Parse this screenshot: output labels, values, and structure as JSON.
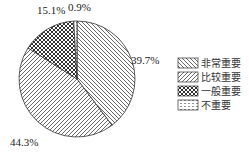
{
  "chart_data": {
    "type": "pie",
    "title": "",
    "categories": [
      "非常重要",
      "比较重要",
      "一般重要",
      "不重要"
    ],
    "values": [
      39.7,
      44.3,
      15.1,
      0.9
    ],
    "labels": [
      "39.7%",
      "44.3%",
      "15.1%",
      "0.9%"
    ],
    "start_angle_deg": 0,
    "direction": "clockwise",
    "fills": [
      "hatch-backslash",
      "hatch-slash",
      "crosshatch",
      "dotted"
    ],
    "legend_position": "right"
  },
  "legend": {
    "items": [
      {
        "label": "非常重要",
        "pattern": "hatch-backslash"
      },
      {
        "label": "比较重要",
        "pattern": "hatch-slash"
      },
      {
        "label": "一般重要",
        "pattern": "crosshatch"
      },
      {
        "label": "不重要",
        "pattern": "dotted"
      }
    ]
  },
  "colors": {
    "stroke": "#333333",
    "background": "#ffffff"
  }
}
